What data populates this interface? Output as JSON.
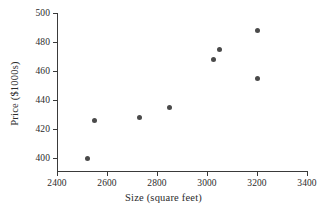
{
  "chart_data": {
    "type": "scatter",
    "title": "",
    "xlabel": "Size (square feet)",
    "ylabel": "Price ($1000s)",
    "xlim": [
      2400,
      3400
    ],
    "ylim": [
      390,
      500
    ],
    "grid": false,
    "legend": null,
    "xticks": [
      2400,
      2600,
      2800,
      3000,
      3200,
      3400
    ],
    "yticks": [
      400,
      420,
      440,
      460,
      480,
      500
    ],
    "xtick_labels": [
      "2400",
      "2600",
      "2800",
      "3000",
      "3200",
      "3400"
    ],
    "ytick_labels": [
      "400",
      "420",
      "440",
      "460",
      "480",
      "500"
    ],
    "marker": "filled-circle",
    "marker_color": "#4a4a4a",
    "axis_color": "#3a3a3a",
    "points": [
      {
        "x": 2520,
        "y": 400
      },
      {
        "x": 2550,
        "y": 426
      },
      {
        "x": 2730,
        "y": 428
      },
      {
        "x": 2850,
        "y": 435
      },
      {
        "x": 3025,
        "y": 468
      },
      {
        "x": 3050,
        "y": 475
      },
      {
        "x": 3200,
        "y": 455
      },
      {
        "x": 3200,
        "y": 488
      }
    ]
  }
}
